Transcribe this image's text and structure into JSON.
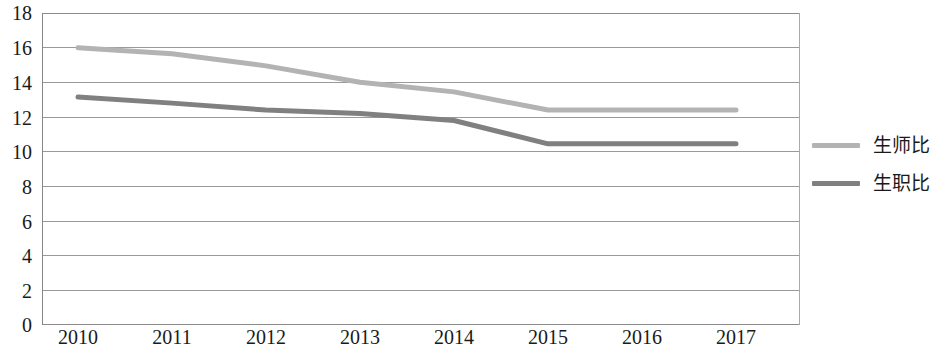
{
  "chart_data": {
    "type": "line",
    "title": "",
    "subtitle": "",
    "xlabel": "",
    "ylabel": "",
    "categories": [
      "2010",
      "2011",
      "2012",
      "2013",
      "2014",
      "2015",
      "2016",
      "2017"
    ],
    "ylim": [
      0,
      18
    ],
    "y_ticks": [
      0,
      2,
      4,
      6,
      8,
      10,
      12,
      14,
      16,
      18
    ],
    "grid": "horizontal",
    "legend_position": "right",
    "series": [
      {
        "name": "生师比",
        "color": "#b3b3b3",
        "values": [
          16.0,
          15.65,
          14.95,
          14.0,
          13.45,
          12.4,
          12.4,
          12.4
        ]
      },
      {
        "name": "生职比",
        "color": "#808080",
        "values": [
          13.15,
          12.8,
          12.4,
          12.2,
          11.8,
          10.45,
          10.45,
          10.45
        ]
      }
    ]
  },
  "axes": {
    "y_tick_labels": [
      "18",
      "16",
      "14",
      "12",
      "10",
      "8",
      "6",
      "4",
      "2",
      "0"
    ],
    "x_tick_labels": [
      "2010",
      "2011",
      "2012",
      "2013",
      "2014",
      "2015",
      "2016",
      "2017"
    ]
  },
  "legend": {
    "items": [
      {
        "label": "生师比",
        "color": "#b3b3b3"
      },
      {
        "label": "生职比",
        "color": "#808080"
      }
    ]
  },
  "style": {
    "axis_color": "#868686",
    "grid_color": "#9a9a9a",
    "plot_border_color": "#868686",
    "text_color": "#1a1a1a",
    "background": "#ffffff"
  }
}
